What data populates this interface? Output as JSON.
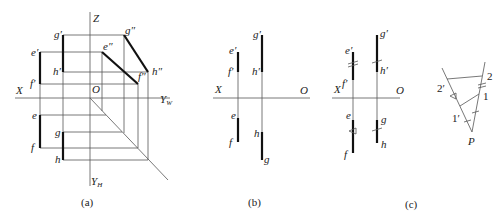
{
  "panels": {
    "a": {
      "caption": "(a)",
      "labels": {
        "Z": "Z",
        "X": "X",
        "O": "O",
        "YW": "Y",
        "YW_sub": "W",
        "YH": "Y",
        "YH_sub": "H",
        "e_p": "e′",
        "f_p": "f′",
        "g_p": "g′",
        "h_p": "h′",
        "e_pp": "e″",
        "f_pp": "f″",
        "g_pp": "g″",
        "h_pp": "h″",
        "e": "e",
        "f": "f",
        "g": "g",
        "h": "h"
      }
    },
    "b": {
      "caption": "(b)",
      "labels": {
        "X": "X",
        "O": "O",
        "e_p": "e′",
        "f_p": "f′",
        "g_p": "g′",
        "h_p": "h′",
        "e": "e",
        "f": "f",
        "g": "g",
        "h": "h"
      }
    },
    "c": {
      "caption": "(c)",
      "labels": {
        "X": "X",
        "O": "O",
        "e_p": "e′",
        "f_p": "f′",
        "g_p": "g′",
        "h_p": "h′",
        "e": "e",
        "f": "f",
        "g": "g",
        "h": "h",
        "pt2p": "2′",
        "pt2": "2",
        "pt1": "1",
        "pt1p": "1′",
        "P": "P"
      }
    }
  }
}
